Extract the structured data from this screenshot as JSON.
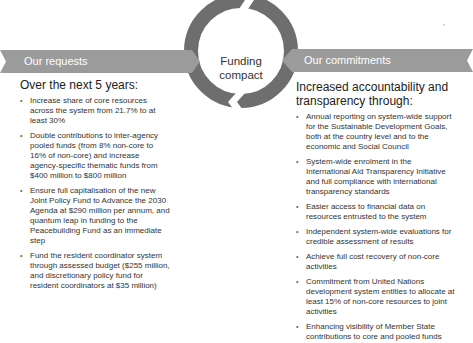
{
  "center": {
    "label_line1": "Funding",
    "label_line2": "compact",
    "ring_color": "#6e6e6e"
  },
  "left": {
    "banner_label": "Our requests",
    "heading": "Over the next 5 years:",
    "items": [
      "Increase share of core resources across the system from 21.7% to at least 30%",
      "Double contributions to inter-agency pooled funds (from 8% non-core to 16% of non-core) and increase agency-specific thematic funds from $400 million to $800 million",
      "Ensure full capitalisation of the new Joint Policy Fund to Advance the 2030 Agenda at $290 million per annum, and quantum leap in funding to the Peacebuilding Fund as an immediate step",
      "Fund the resident coordinator system through assessed budget ($255 million, and discretionary policy fund for resident coordinators at $35 million)"
    ]
  },
  "right": {
    "banner_label": "Our commitments",
    "heading_line1": "Increased accountability and",
    "heading_line2": "transparency through:",
    "items": [
      "Annual reporting on system-wide support for the Sustainable Development Goals, both at the country level and to the economic and Social Council",
      "System-wide enrolment in the International Aid Transparency Initiative and full compliance with international transparency standards",
      "Easier access to financial data on resources entrusted to the system",
      "Independent system-wide evaluations for credible assessment of results",
      "Achieve full cost recovery of non-core activities",
      "Commitment from United Nations development system entities to allocate at least 15% of non-core resources to joint activities",
      "Enhancing visibility of Member State contributions to core and pooled funds"
    ]
  },
  "colors": {
    "banner": "#9b9b9b",
    "banner_text": "#ffffff",
    "text": "#333333"
  }
}
